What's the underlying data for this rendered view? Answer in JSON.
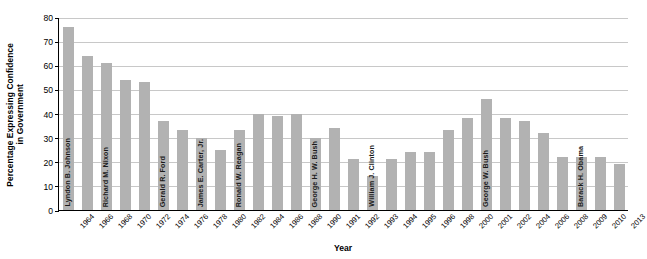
{
  "chart_data": {
    "type": "bar",
    "title": "",
    "xlabel": "Year",
    "ylabel_line1": "Percentage Expressing Confidence",
    "ylabel_line2": "in Government",
    "ylim": [
      0,
      80
    ],
    "yticks": [
      0,
      10,
      20,
      30,
      40,
      50,
      60,
      70,
      80
    ],
    "grid": true,
    "legend": "none",
    "bar_color": "#b2b2b2",
    "categories": [
      "1964",
      "1966",
      "1968",
      "1970",
      "1972",
      "1974",
      "1976",
      "1978",
      "1980",
      "1982",
      "1984",
      "1986",
      "1988",
      "1990",
      "1991",
      "1992",
      "1993",
      "1994",
      "1995",
      "1996",
      "1998",
      "2000",
      "2001",
      "2002",
      "2004",
      "2006",
      "2008",
      "2009",
      "2010",
      "2013"
    ],
    "values": [
      76,
      64,
      61,
      54,
      53,
      37,
      33,
      30,
      25,
      33,
      40,
      39,
      40,
      30,
      34,
      21,
      14,
      21,
      24,
      24,
      33,
      38,
      46,
      38,
      37,
      32,
      22,
      22,
      22,
      19
    ],
    "annotations": [
      {
        "label": "Lyndon B. Johnson",
        "category": "1964"
      },
      {
        "label": "Richard M. Nixon",
        "category": "1968"
      },
      {
        "label": "Gerald R. Ford",
        "category": "1974"
      },
      {
        "label": "James E. Carter, Jr.",
        "category": "1978"
      },
      {
        "label": "Ronald W. Reagan",
        "category": "1982"
      },
      {
        "label": "George H. W. Bush",
        "category": "1990"
      },
      {
        "label": "William J. Clinton",
        "category": "1993"
      },
      {
        "label": "George W. Bush",
        "category": "2001"
      },
      {
        "label": "Barack H. Obama",
        "category": "2009"
      }
    ]
  }
}
